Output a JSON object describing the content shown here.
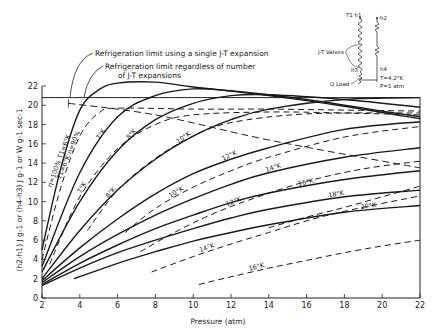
{
  "chart_data": {
    "type": "line",
    "title": "",
    "xlabel": "Pressure (atm)",
    "ylabel": "(h2-h1) J g-1 or (h4-h3) J g-1 or W g-1 sec-1",
    "xlim": [
      2,
      22
    ],
    "ylim": [
      0,
      22
    ],
    "xticks": [
      "2",
      "4",
      "6",
      "8",
      "10",
      "12",
      "14",
      "16",
      "18",
      "20",
      "22"
    ],
    "yticks": [
      "0",
      "2",
      "4",
      "6",
      "8",
      "10",
      "12",
      "14",
      "16",
      "18",
      "20",
      "22"
    ],
    "grid": false,
    "annotations": [
      {
        "text": "Refrigeration limit using a single J-T expansion"
      },
      {
        "text": "Refrigeration limit regardless of number"
      },
      {
        "text": "of J-T expansions"
      }
    ],
    "limit_lines": [
      {
        "name": "single-jt-limit",
        "style": "solid",
        "points": [
          [
            2,
            20.8
          ],
          [
            22,
            20.8
          ]
        ]
      },
      {
        "name": "multi-jt-limit",
        "style": "dashed",
        "points": [
          [
            3.4,
            20.2
          ],
          [
            8,
            19.0
          ],
          [
            14,
            16.4
          ],
          [
            22,
            13.5
          ]
        ]
      }
    ],
    "series": [
      {
        "name": "η=100% T1=6°K",
        "style": "solid",
        "label": "η=100% T1=6°K",
        "points": [
          [
            2,
            5.0
          ],
          [
            3,
            13.5
          ],
          [
            4,
            19.5
          ],
          [
            5,
            21.6
          ],
          [
            6,
            22.3
          ],
          [
            8,
            22.4
          ],
          [
            10,
            21.9
          ],
          [
            14,
            21.0
          ],
          [
            18,
            19.9
          ],
          [
            22,
            18.6
          ]
        ]
      },
      {
        "name": "T1=6°K η=90%",
        "style": "dashed",
        "label": "T1=6°K η=90%",
        "points": [
          [
            2,
            4.0
          ],
          [
            3,
            11.5
          ],
          [
            4,
            16.8
          ],
          [
            5,
            19.2
          ],
          [
            6,
            19.7
          ],
          [
            10,
            19.6
          ],
          [
            14,
            19.6
          ],
          [
            18,
            19.5
          ],
          [
            22,
            19.4
          ]
        ]
      },
      {
        "name": "7°K",
        "style": "solid",
        "label": "7°K",
        "points": [
          [
            2,
            3.3
          ],
          [
            4,
            13.0
          ],
          [
            6,
            18.8
          ],
          [
            8,
            21.0
          ],
          [
            10,
            21.7
          ],
          [
            12,
            21.5
          ],
          [
            16,
            20.6
          ],
          [
            20,
            19.4
          ],
          [
            22,
            18.8
          ]
        ]
      },
      {
        "name": "7°K dashed",
        "style": "dashed",
        "label": "7°K",
        "points": [
          [
            2.4,
            3.5
          ],
          [
            4,
            10.5
          ],
          [
            6,
            15.5
          ],
          [
            8,
            18.0
          ],
          [
            10,
            19.0
          ],
          [
            14,
            19.3
          ],
          [
            18,
            19.2
          ],
          [
            22,
            19.0
          ]
        ]
      },
      {
        "name": "8°K",
        "style": "solid",
        "label": "8°K",
        "points": [
          [
            2,
            2.7
          ],
          [
            4,
            10.0
          ],
          [
            6,
            15.3
          ],
          [
            8,
            18.5
          ],
          [
            10,
            20.2
          ],
          [
            12,
            21.0
          ],
          [
            14,
            21.1
          ],
          [
            18,
            20.6
          ],
          [
            22,
            19.8
          ]
        ]
      },
      {
        "name": "8°K dashed",
        "style": "dashed",
        "label": "8°K",
        "points": [
          [
            4.4,
            7.0
          ],
          [
            6,
            11.2
          ],
          [
            8,
            14.5
          ],
          [
            10,
            16.8
          ],
          [
            12,
            18.2
          ],
          [
            16,
            19.1
          ],
          [
            22,
            19.2
          ]
        ]
      },
      {
        "name": "10°K",
        "style": "solid",
        "label": "10°K",
        "points": [
          [
            2,
            2.0
          ],
          [
            4,
            7.0
          ],
          [
            6,
            11.2
          ],
          [
            8,
            14.4
          ],
          [
            10,
            16.8
          ],
          [
            12,
            18.5
          ],
          [
            14,
            19.6
          ],
          [
            18,
            20.6
          ],
          [
            22,
            20.8
          ]
        ]
      },
      {
        "name": "10°K dashed",
        "style": "dashed",
        "label": "10°K",
        "points": [
          [
            6.4,
            6.8
          ],
          [
            8,
            9.3
          ],
          [
            10,
            11.5
          ],
          [
            12,
            13.2
          ],
          [
            14,
            14.6
          ],
          [
            18,
            16.7
          ],
          [
            22,
            17.8
          ]
        ]
      },
      {
        "name": "12°K",
        "style": "solid",
        "label": "12°K",
        "points": [
          [
            2,
            1.8
          ],
          [
            4,
            5.2
          ],
          [
            6,
            8.2
          ],
          [
            8,
            10.8
          ],
          [
            10,
            12.9
          ],
          [
            12,
            14.4
          ],
          [
            14,
            15.6
          ],
          [
            18,
            17.5
          ],
          [
            22,
            18.3
          ]
        ]
      },
      {
        "name": "12°K dashed",
        "style": "dashed",
        "label": "12°K",
        "points": [
          [
            7.2,
            4.8
          ],
          [
            9,
            6.8
          ],
          [
            11,
            8.7
          ],
          [
            13,
            10.2
          ],
          [
            16,
            12.1
          ],
          [
            19,
            13.4
          ],
          [
            22,
            14.2
          ]
        ]
      },
      {
        "name": "14°K",
        "style": "solid",
        "label": "14°K",
        "points": [
          [
            2,
            1.6
          ],
          [
            4,
            4.3
          ],
          [
            6,
            6.6
          ],
          [
            8,
            8.6
          ],
          [
            10,
            10.3
          ],
          [
            12,
            11.8
          ],
          [
            14,
            13.0
          ],
          [
            18,
            14.6
          ],
          [
            22,
            15.6
          ]
        ]
      },
      {
        "name": "14°K dashed",
        "style": "dashed",
        "label": "14°K",
        "points": [
          [
            7.8,
            2.7
          ],
          [
            10,
            4.3
          ],
          [
            12,
            5.6
          ],
          [
            14,
            6.8
          ],
          [
            16,
            8.0
          ],
          [
            18,
            9.0
          ],
          [
            22,
            10.6
          ]
        ]
      },
      {
        "name": "16°K",
        "style": "solid",
        "label": "16°K",
        "points": [
          [
            2,
            1.4
          ],
          [
            4,
            3.6
          ],
          [
            6,
            5.5
          ],
          [
            8,
            7.2
          ],
          [
            10,
            8.6
          ],
          [
            12,
            9.9
          ],
          [
            14,
            10.9
          ],
          [
            18,
            12.3
          ],
          [
            22,
            13.2
          ]
        ]
      },
      {
        "name": "16°K dashed",
        "style": "dashed",
        "label": "16°K",
        "points": [
          [
            10.3,
            1.4
          ],
          [
            12,
            2.2
          ],
          [
            14,
            3.1
          ],
          [
            16,
            3.9
          ],
          [
            18,
            4.7
          ],
          [
            20,
            5.4
          ],
          [
            22,
            6.0
          ]
        ]
      },
      {
        "name": "18°K",
        "style": "solid",
        "label": "18°K",
        "points": [
          [
            2,
            1.3
          ],
          [
            4,
            3.1
          ],
          [
            6,
            4.7
          ],
          [
            8,
            6.0
          ],
          [
            10,
            7.2
          ],
          [
            12,
            8.3
          ],
          [
            14,
            9.2
          ],
          [
            18,
            10.5
          ],
          [
            22,
            11.2
          ]
        ]
      },
      {
        "name": "20°K",
        "style": "solid",
        "label": "20°K",
        "points": [
          [
            3.7,
            2.0
          ],
          [
            6,
            3.6
          ],
          [
            8,
            4.8
          ],
          [
            10,
            5.9
          ],
          [
            12,
            6.8
          ],
          [
            14,
            7.6
          ],
          [
            18,
            8.9
          ],
          [
            22,
            9.6
          ]
        ]
      },
      {
        "name": "20°K dashed",
        "style": "dashed",
        "label": "20°K",
        "points": [
          [
            14,
            7.3
          ],
          [
            16,
            8.4
          ],
          [
            18,
            9.4
          ],
          [
            20,
            10.5
          ],
          [
            22,
            11.6
          ]
        ]
      }
    ],
    "inset_diagram": {
      "labels": [
        "T1 h1",
        "h2",
        "J-T Valves",
        "h3",
        "h4",
        "Q Load",
        "T=4.2°K",
        "P=1 atm"
      ]
    }
  }
}
